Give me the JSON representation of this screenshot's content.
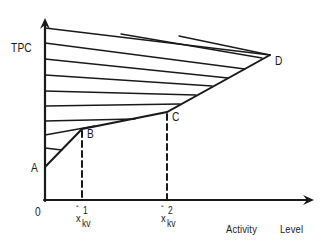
{
  "diagram": {
    "y_axis_label": "TPC",
    "x_axis_label_1": "Activity",
    "x_axis_label_2": "Level",
    "origin_label": "0",
    "points": {
      "A": {
        "label": "A"
      },
      "B": {
        "label": "B"
      },
      "C": {
        "label": "C"
      },
      "D": {
        "label": "D"
      }
    },
    "ticks": [
      {
        "hat": "ˆ",
        "base": "x",
        "sup": "1",
        "sub": "kv"
      },
      {
        "hat": "ˆ",
        "base": "x",
        "sup": "2",
        "sub": "kv"
      }
    ],
    "line_color": "#1a1a1a"
  }
}
